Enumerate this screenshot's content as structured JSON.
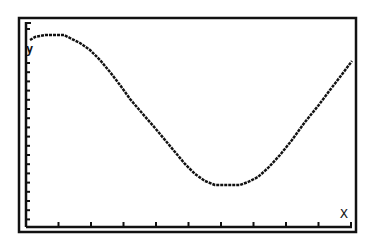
{
  "window": {
    "type": "graphing-calculator-screen",
    "background": "#ffffff",
    "ink": "#111111"
  },
  "axes": {
    "x_label": "X",
    "y_label": "y",
    "x_ticks_count": 10,
    "y_ticks_count": 18
  },
  "chart_data": {
    "type": "line",
    "title": "",
    "xlabel": "X",
    "ylabel": "y",
    "grid": false,
    "points_px": [
      [
        30,
        40
      ],
      [
        35,
        37
      ],
      [
        45,
        35
      ],
      [
        64,
        35
      ],
      [
        70,
        38
      ],
      [
        80,
        43
      ],
      [
        90,
        50
      ],
      [
        100,
        60
      ],
      [
        110,
        72
      ],
      [
        120,
        85
      ],
      [
        130,
        99
      ],
      [
        142,
        113
      ],
      [
        155,
        128
      ],
      [
        165,
        140
      ],
      [
        175,
        152
      ],
      [
        185,
        164
      ],
      [
        195,
        174
      ],
      [
        205,
        181
      ],
      [
        215,
        185
      ],
      [
        240,
        185
      ],
      [
        248,
        182
      ],
      [
        258,
        177
      ],
      [
        268,
        168
      ],
      [
        280,
        155
      ],
      [
        292,
        140
      ],
      [
        305,
        122
      ],
      [
        318,
        106
      ],
      [
        330,
        90
      ],
      [
        340,
        77
      ],
      [
        352,
        61
      ]
    ]
  }
}
